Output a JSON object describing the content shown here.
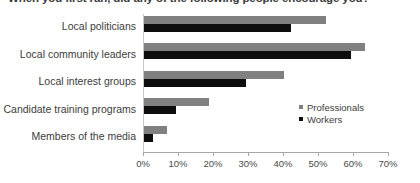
{
  "chart_data": {
    "type": "bar",
    "orientation": "horizontal",
    "title": "When you first ran, did any of the following people encourage you?",
    "xlabel": "",
    "ylabel": "",
    "categories": [
      "Local politicians",
      "Local community leaders",
      "Local interest groups",
      "Candidate training programs",
      "Members of the media"
    ],
    "series": [
      {
        "name": "Professionals",
        "color": "#808080",
        "values": [
          52,
          63,
          40,
          18.5,
          6.5
        ]
      },
      {
        "name": "Workers",
        "color": "#0d0d0d",
        "values": [
          42,
          59,
          29,
          9,
          2.5
        ]
      }
    ],
    "xlim": [
      0,
      70
    ],
    "xticks": [
      0,
      10,
      20,
      30,
      40,
      50,
      60,
      70
    ],
    "xtick_labels": [
      "0%",
      "10%",
      "20%",
      "30%",
      "40%",
      "50%",
      "60%",
      "70%"
    ],
    "grid": false,
    "legend_position": "inside-right"
  },
  "legend": {
    "entries": [
      {
        "label": "Professionals",
        "color": "#808080"
      },
      {
        "label": "Workers",
        "color": "#0d0d0d"
      }
    ]
  }
}
